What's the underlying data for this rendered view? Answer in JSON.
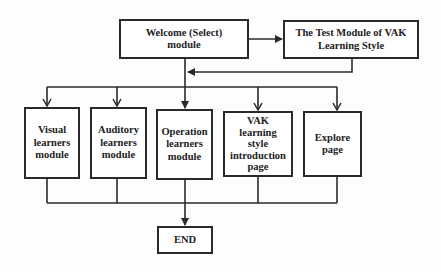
{
  "diagram": {
    "type": "flowchart",
    "nodes": [
      {
        "id": "welcome",
        "label": "Welcome (Select) module"
      },
      {
        "id": "vak_test",
        "label": "The Test Module of VAK Learning Style"
      },
      {
        "id": "visual",
        "label": "Visual learners module"
      },
      {
        "id": "auditory",
        "label": "Auditory learners module"
      },
      {
        "id": "operation",
        "label": "Operation learners module"
      },
      {
        "id": "vak_intro",
        "label": "VAK learning style introduction page"
      },
      {
        "id": "explore",
        "label": "Explore page"
      },
      {
        "id": "end",
        "label": "END"
      }
    ],
    "edges": [
      {
        "from": "welcome",
        "to": "vak_test"
      },
      {
        "from": "vak_test",
        "to": "welcome_branch"
      },
      {
        "from": "welcome_branch",
        "to": "visual"
      },
      {
        "from": "welcome_branch",
        "to": "auditory"
      },
      {
        "from": "welcome_branch",
        "to": "operation"
      },
      {
        "from": "welcome_branch",
        "to": "vak_intro"
      },
      {
        "from": "welcome_branch",
        "to": "explore"
      },
      {
        "from": "visual",
        "to": "end"
      },
      {
        "from": "auditory",
        "to": "end"
      },
      {
        "from": "operation",
        "to": "end"
      },
      {
        "from": "vak_intro",
        "to": "end"
      },
      {
        "from": "explore",
        "to": "end"
      }
    ]
  },
  "labels": {
    "welcome": [
      "Welcome (Select)",
      "module"
    ],
    "vak_test": [
      "The Test Module of VAK",
      "Learning Style"
    ],
    "visual": [
      "Visual",
      "learners",
      "module"
    ],
    "auditory": [
      "Auditory",
      "learners",
      "module"
    ],
    "operation": [
      "Operation",
      "learners",
      "module"
    ],
    "vak_intro": [
      "VAK",
      "learning",
      "style",
      "introduction",
      "page"
    ],
    "explore": [
      "Explore",
      "page"
    ],
    "end": [
      "END"
    ]
  },
  "colors": {
    "line": "#2a2a2a",
    "box_fill": "#ffffff",
    "background": "#fdfdfd"
  }
}
